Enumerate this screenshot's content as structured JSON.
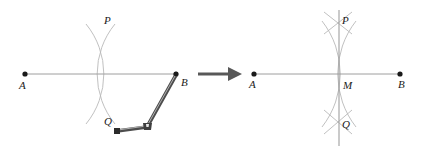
{
  "figure": {
    "background_color": "#ffffff",
    "line_color": "#9a9a9a",
    "arc_color": "#b0b0b0",
    "point_color": "#1a1a1a",
    "compass_color": "#4a4a4a",
    "arrow_color": "#555555",
    "label_color": "#1a1a1a"
  },
  "left_panel": {
    "name": "construction-step-1",
    "segment": {
      "label": "AB",
      "endpoint_a": {
        "label": "A",
        "x": 25,
        "y": 74
      },
      "endpoint_b": {
        "label": "B",
        "x": 176,
        "y": 74
      }
    },
    "arc_intersections": [
      {
        "label": "P",
        "x": 100,
        "y": 22
      },
      {
        "label": "Q",
        "x": 100,
        "y": 117
      }
    ],
    "arcs": [
      {
        "name": "arc-from-A",
        "center_label": "A",
        "radius": 79
      },
      {
        "name": "arc-from-B",
        "center_label": "B",
        "radius": 79
      }
    ],
    "compass": {
      "name": "compass-tool",
      "pivot_point": {
        "x": 176,
        "y": 74
      },
      "hinge_point": {
        "x": 146,
        "y": 127
      },
      "handle_end": {
        "x": 116,
        "y": 131
      }
    }
  },
  "arrow": {
    "label": "transforms-to",
    "glyph": "→",
    "x1": 198,
    "x2": 238,
    "y": 74
  },
  "right_panel": {
    "name": "construction-step-2",
    "segment": {
      "label": "AB",
      "endpoint_a": {
        "label": "A",
        "x": 254,
        "y": 74
      },
      "endpoint_b": {
        "label": "B",
        "x": 400,
        "y": 74
      }
    },
    "arc_intersections": [
      {
        "label": "P",
        "x": 339,
        "y": 22
      },
      {
        "label": "Q",
        "x": 339,
        "y": 122
      }
    ],
    "midpoint": {
      "label": "M",
      "x": 339,
      "y": 74
    },
    "perpendicular_bisector": {
      "label": "PQ",
      "x": 339,
      "y_top": 10,
      "y_bottom": 146
    },
    "arcs": [
      {
        "name": "arc-from-A",
        "center_label": "A",
        "radius": 86
      },
      {
        "name": "arc-from-B",
        "center_label": "B",
        "radius": 86
      }
    ]
  }
}
